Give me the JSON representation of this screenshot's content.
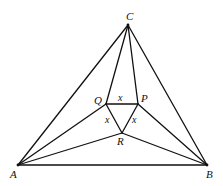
{
  "diagram": {
    "points": {
      "A": {
        "x": 18,
        "y": 165
      },
      "B": {
        "x": 207,
        "y": 165
      },
      "C": {
        "x": 128,
        "y": 25
      },
      "Q": {
        "x": 106,
        "y": 104
      },
      "P": {
        "x": 138,
        "y": 104
      },
      "R": {
        "x": 122,
        "y": 133
      }
    },
    "vertex_labels": {
      "A": "A",
      "B": "B",
      "C": "C",
      "P": "P",
      "Q": "Q",
      "R": "R"
    },
    "side_labels": {
      "QP": "x",
      "QR": "x",
      "PR": "x"
    },
    "edges": [
      [
        "A",
        "B"
      ],
      [
        "B",
        "C"
      ],
      [
        "C",
        "A"
      ],
      [
        "C",
        "Q"
      ],
      [
        "C",
        "P"
      ],
      [
        "A",
        "Q"
      ],
      [
        "A",
        "R"
      ],
      [
        "B",
        "P"
      ],
      [
        "B",
        "R"
      ],
      [
        "Q",
        "P"
      ],
      [
        "P",
        "R"
      ],
      [
        "R",
        "Q"
      ]
    ]
  }
}
